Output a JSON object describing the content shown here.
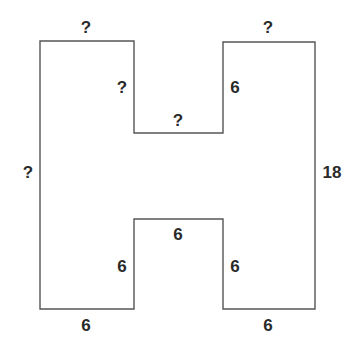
{
  "diagram": {
    "shape": "H-shaped polygon (rectilinear)",
    "stroke_color": "#555555",
    "label_color": "#2a2a2a",
    "labels": {
      "top_left_width": "?",
      "top_notch_left_side": "?",
      "top_notch_bottom": "?",
      "top_notch_right_side": "6",
      "top_right_width": "?",
      "left_height": "?",
      "right_height": "18",
      "bottom_notch_top": "6",
      "bottom_notch_left_side": "6",
      "bottom_notch_right_side": "6",
      "bottom_left_width": "6",
      "bottom_right_width": "6"
    }
  }
}
